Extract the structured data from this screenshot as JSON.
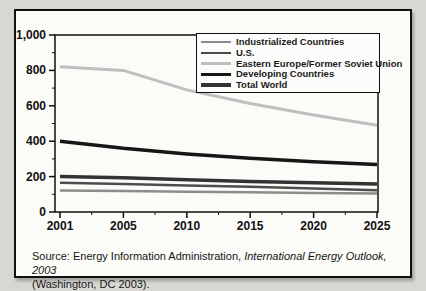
{
  "figure": {
    "source": {
      "line1_normal": "Source: Energy Information Administration, ",
      "line1_italic": "International Energy Outlook, 2003",
      "line2": "(Washington, DC 2003)."
    }
  },
  "chart_data": {
    "type": "line",
    "x": [
      2001,
      2005,
      2010,
      2015,
      2020,
      2025
    ],
    "x_tick_labels": [
      "2001",
      "2005",
      "2010",
      "2015",
      "2020",
      "2025"
    ],
    "y_axis": {
      "min": 0,
      "max": 1000,
      "major_step": 200,
      "minor_step": 100,
      "tick_labels": [
        "0",
        "200",
        "400",
        "600",
        "800",
        "1,000"
      ]
    },
    "grid": false,
    "legend_position": "top-right",
    "series": [
      {
        "name": "Industrialized Countries",
        "color": "#8c8c8c",
        "width": 2.5,
        "values": [
          122,
          119,
          115,
          111,
          108,
          105
        ]
      },
      {
        "name": "U.S.",
        "color": "#4d4d4d",
        "width": 2.5,
        "values": [
          165,
          158,
          150,
          142,
          133,
          123
        ]
      },
      {
        "name": "Eastern Europe/Former Soviet Union",
        "color": "#bfbfbf",
        "width": 3,
        "values": [
          820,
          800,
          690,
          613,
          548,
          490
        ]
      },
      {
        "name": "Developing Countries",
        "color": "#161616",
        "width": 3.5,
        "values": [
          400,
          360,
          328,
          303,
          284,
          268
        ]
      },
      {
        "name": "Total World",
        "color": "#333333",
        "width": 3.5,
        "values": [
          200,
          193,
          182,
          173,
          165,
          158
        ]
      }
    ]
  }
}
